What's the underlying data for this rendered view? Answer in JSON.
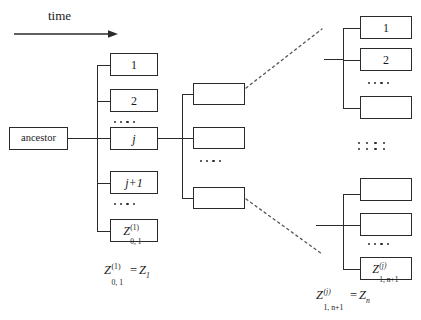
{
  "figure": {
    "type": "branching-process-tree-diagram",
    "axis": {
      "label": "time",
      "direction": "left-to-right"
    },
    "root": {
      "label": "ancestor"
    },
    "generation1": {
      "caption_var": "Z",
      "caption_sup": "(1)",
      "caption_sub": "0, 1",
      "caption_eq": "=",
      "caption_rhs_var": "Z",
      "caption_rhs_sub": "1",
      "nodes": [
        {
          "label": "1",
          "style": "plain"
        },
        {
          "label": "2",
          "style": "plain"
        },
        {
          "label": "…",
          "style": "dots"
        },
        {
          "label": "j",
          "style": "italic"
        },
        {
          "label": "j+1",
          "style": "italic-mixed"
        },
        {
          "label": "…",
          "style": "dots"
        },
        {
          "label": "Z",
          "style": "math",
          "sup": "(1)",
          "sub": "0, 1"
        }
      ]
    },
    "generation2": {
      "nodes": [
        {
          "label": "",
          "style": "blank"
        },
        {
          "label": "",
          "style": "blank"
        },
        {
          "label": "…",
          "style": "dots"
        },
        {
          "label": "",
          "style": "blank"
        }
      ]
    },
    "expansion_top": {
      "nodes": [
        {
          "label": "1",
          "style": "plain"
        },
        {
          "label": "2",
          "style": "plain"
        },
        {
          "label": "…",
          "style": "dots"
        },
        {
          "label": "",
          "style": "blank"
        }
      ]
    },
    "expansion_bottom": {
      "caption_var": "Z",
      "caption_sup": "(j)",
      "caption_sub": "1, n+1",
      "caption_eq": "=",
      "caption_rhs_var": "Z",
      "caption_rhs_sub": "n",
      "nodes": [
        {
          "label": "",
          "style": "blank"
        },
        {
          "label": "",
          "style": "blank"
        },
        {
          "label": "…",
          "style": "dots"
        },
        {
          "label": "Z",
          "style": "math",
          "sup": "(j)",
          "sub": "1, n+1"
        }
      ]
    },
    "vertical_ellipsis": {
      "rows": 2,
      "columns": 4
    },
    "colors": {
      "stroke": "#2b2b2b",
      "text": "#1a1a1a",
      "background": "#ffffff"
    }
  }
}
